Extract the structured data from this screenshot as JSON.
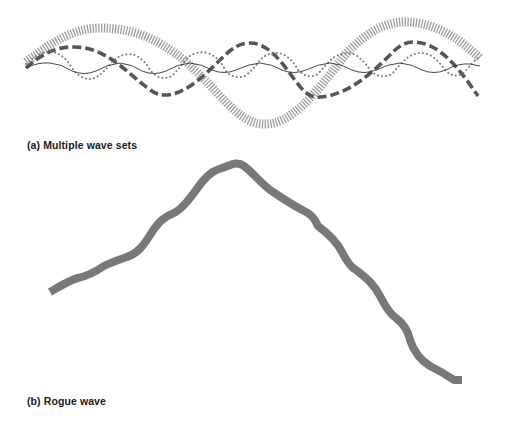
{
  "figure": {
    "panel_a": {
      "caption": "(a) Multiple wave sets",
      "waves": [
        {
          "name": "long-swell",
          "style": "thick-hatched",
          "color": "#9a9a9a"
        },
        {
          "name": "medium-swell",
          "style": "heavy-dashed",
          "color": "#555555"
        },
        {
          "name": "short-wave",
          "style": "dotted",
          "color": "#7a7a7a"
        },
        {
          "name": "ripple",
          "style": "thin-solid",
          "color": "#333333"
        }
      ]
    },
    "panel_b": {
      "caption": "(b) Rogue wave",
      "wave": {
        "name": "rogue-wave",
        "style": "thick-solid",
        "color": "#777777"
      }
    }
  }
}
